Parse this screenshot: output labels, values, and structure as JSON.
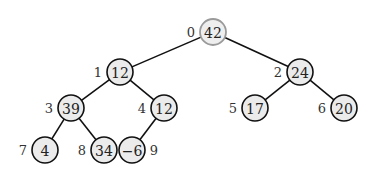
{
  "diagram": {
    "type": "binary-heap-tree",
    "node_radius": 13,
    "colors": {
      "edge": "#111111",
      "node_fill": "#ebebeb",
      "node_stroke": "#111111",
      "root_fill": "#eeeeee",
      "root_stroke": "#9a9a9a",
      "text": "#222222"
    },
    "nodes": [
      {
        "index": "0",
        "value": "42",
        "x": 213,
        "y": 32,
        "label_side": "left",
        "root": true
      },
      {
        "index": "1",
        "value": "12",
        "x": 120,
        "y": 72,
        "label_side": "left"
      },
      {
        "index": "2",
        "value": "24",
        "x": 300,
        "y": 72,
        "label_side": "left"
      },
      {
        "index": "3",
        "value": "39",
        "x": 71,
        "y": 108,
        "label_side": "left"
      },
      {
        "index": "4",
        "value": "12",
        "x": 164,
        "y": 108,
        "label_side": "left"
      },
      {
        "index": "5",
        "value": "17",
        "x": 255,
        "y": 108,
        "label_side": "left"
      },
      {
        "index": "6",
        "value": "20",
        "x": 344,
        "y": 108,
        "label_side": "left"
      },
      {
        "index": "7",
        "value": "4",
        "x": 45,
        "y": 150,
        "label_side": "left"
      },
      {
        "index": "8",
        "value": "34",
        "x": 104,
        "y": 150,
        "label_side": "left"
      },
      {
        "index": "9",
        "value": "−6",
        "x": 132,
        "y": 150,
        "label_side": "right"
      }
    ],
    "edges": [
      {
        "from": 0,
        "to": 1
      },
      {
        "from": 0,
        "to": 2
      },
      {
        "from": 1,
        "to": 3
      },
      {
        "from": 1,
        "to": 4
      },
      {
        "from": 2,
        "to": 5
      },
      {
        "from": 2,
        "to": 6
      },
      {
        "from": 3,
        "to": 7
      },
      {
        "from": 3,
        "to": 8
      },
      {
        "from": 4,
        "to": 9
      }
    ]
  }
}
